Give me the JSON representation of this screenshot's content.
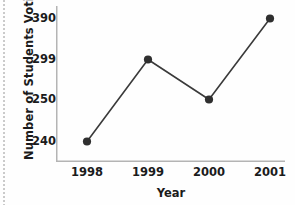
{
  "chart_data": {
    "type": "line",
    "title": "",
    "xlabel": "Year",
    "ylabel": "Number of Students Voting",
    "categories": [
      "1998",
      "1999",
      "2000",
      "2001"
    ],
    "values": [
      240,
      299,
      250,
      390
    ],
    "ytick_labels": [
      "390",
      "299",
      "250",
      "240"
    ],
    "ytick_values": [
      390,
      299,
      250,
      240
    ],
    "axis_style": "categorical-spaced",
    "grid": false,
    "legend": false,
    "series": [
      {
        "name": "Number of Students Voting",
        "values": [
          240,
          299,
          250,
          390
        ]
      }
    ],
    "points": [
      {
        "x": "1998",
        "y": 240
      },
      {
        "x": "1999",
        "y": 299
      },
      {
        "x": "2000",
        "y": 250
      },
      {
        "x": "2001",
        "y": 390
      }
    ],
    "colors": {
      "line": "#3a3a3a",
      "marker": "#2f2f2f",
      "axis": "#b4b4b4",
      "text": "#1b1b1b",
      "background": "#fefefe"
    }
  }
}
